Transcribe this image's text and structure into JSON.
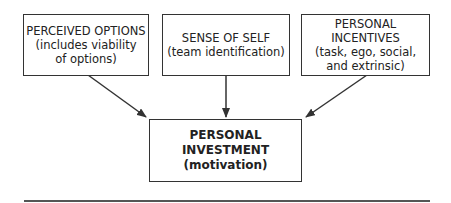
{
  "diagram": {
    "boxes": [
      {
        "id": "perceived-options",
        "title": "PERCEIVED OPTIONS",
        "lines": [
          "(includes viability",
          "of options)"
        ]
      },
      {
        "id": "sense-of-self",
        "title": "SENSE OF SELF",
        "lines": [
          "(team identification)"
        ]
      },
      {
        "id": "personal-incentives",
        "title": "PERSONAL INCENTIVES",
        "lines": [
          "(task, ego, social,",
          "and extrinsic)"
        ]
      }
    ],
    "target": {
      "id": "personal-investment",
      "title": "PERSONAL INVESTMENT",
      "subtitle": "(motivation)"
    },
    "edges": [
      {
        "from": "perceived-options",
        "to": "personal-investment"
      },
      {
        "from": "sense-of-self",
        "to": "personal-investment"
      },
      {
        "from": "personal-incentives",
        "to": "personal-investment"
      }
    ],
    "colors": {
      "stroke": "#333333",
      "background": "#ffffff"
    }
  }
}
